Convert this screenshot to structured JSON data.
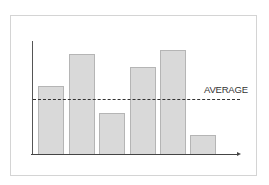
{
  "chart_data": {
    "type": "bar",
    "title": "",
    "xlabel": "",
    "ylabel": "",
    "categories": [
      "1",
      "2",
      "3",
      "4",
      "5",
      "6"
    ],
    "values": [
      68,
      100,
      41,
      87,
      104,
      19
    ],
    "value_units": "relative height (no axis scale shown)",
    "average": 55,
    "annotations": [
      {
        "text": "AVERAGE",
        "type": "dashed horizontal reference line"
      }
    ],
    "grid": false,
    "legend": null,
    "axis_ticks": false,
    "bar_color": "#d9d9d9",
    "bar_border_color": "#b5b5b5"
  },
  "labels": {
    "average": "AVERAGE"
  },
  "layout": {
    "baseline_y": 154,
    "bar_width": 26,
    "bar_x": [
      38,
      69,
      99,
      130,
      160,
      190
    ]
  }
}
